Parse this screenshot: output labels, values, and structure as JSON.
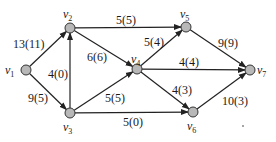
{
  "graph": {
    "type": "network-flow",
    "nodes": [
      {
        "id": "v1",
        "name": "v",
        "sub": "1",
        "x": 26,
        "y": 70,
        "lx": 5,
        "ly": 74
      },
      {
        "id": "v2",
        "name": "v",
        "sub": "2",
        "x": 70,
        "y": 28,
        "lx": 63,
        "ly": 18
      },
      {
        "id": "v3",
        "name": "v",
        "sub": "3",
        "x": 70,
        "y": 113,
        "lx": 63,
        "ly": 131
      },
      {
        "id": "v4",
        "name": "v",
        "sub": "4",
        "x": 137,
        "y": 69,
        "lx": 131,
        "ly": 63
      },
      {
        "id": "v5",
        "name": "v",
        "sub": "5",
        "x": 186,
        "y": 27,
        "lx": 180,
        "ly": 18
      },
      {
        "id": "v6",
        "name": "v",
        "sub": "6",
        "x": 193,
        "y": 112,
        "lx": 187,
        "ly": 130
      },
      {
        "id": "v7",
        "name": "v",
        "sub": "7",
        "x": 250,
        "y": 70,
        "lx": 257,
        "ly": 74
      }
    ],
    "edges": [
      {
        "from": "v1",
        "to": "v2",
        "label": "13(11)",
        "lx": 13,
        "ly": 48
      },
      {
        "from": "v1",
        "to": "v3",
        "label": "9(5)",
        "lx": 28,
        "ly": 102
      },
      {
        "from": "v3",
        "to": "v2",
        "label": "4(0)",
        "lx": 48,
        "ly": 78
      },
      {
        "from": "v2",
        "to": "v5",
        "label": "5(5)",
        "lx": 116,
        "ly": 24
      },
      {
        "from": "v2",
        "to": "v4",
        "label": "6(6)",
        "lx": 87,
        "ly": 61
      },
      {
        "from": "v3",
        "to": "v4",
        "label": "5(5)",
        "lx": 105,
        "ly": 102
      },
      {
        "from": "v3",
        "to": "v6",
        "label": "5(0)",
        "lx": 123,
        "ly": 126
      },
      {
        "from": "v4",
        "to": "v5",
        "label": "5(4)",
        "lx": 144,
        "ly": 46
      },
      {
        "from": "v4",
        "to": "v7",
        "label": "4(4)",
        "lx": 179,
        "ly": 66
      },
      {
        "from": "v4",
        "to": "v6",
        "label": "4(3)",
        "lx": 172,
        "ly": 94
      },
      {
        "from": "v5",
        "to": "v7",
        "label": "9(9)",
        "lx": 218,
        "ly": 47
      },
      {
        "from": "v6",
        "to": "v7",
        "label": "10(3)",
        "lx": 222,
        "ly": 105
      }
    ]
  }
}
